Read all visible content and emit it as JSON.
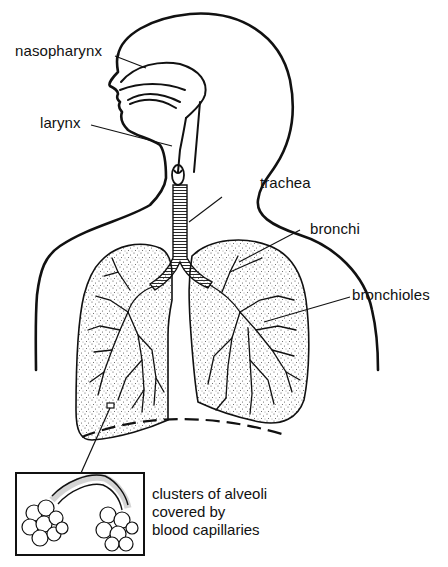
{
  "diagram": {
    "labels": {
      "nasopharynx": "nasopharynx",
      "larynx": "larynx",
      "trachea": "trachea",
      "bronchi": "bronchi",
      "bronchioles": "bronchioles"
    },
    "inset_caption": [
      "clusters of alveoli",
      "covered by",
      "blood capillaries"
    ],
    "colors": {
      "ink": "#111111",
      "background": "#ffffff",
      "stipple": "#555555"
    }
  }
}
